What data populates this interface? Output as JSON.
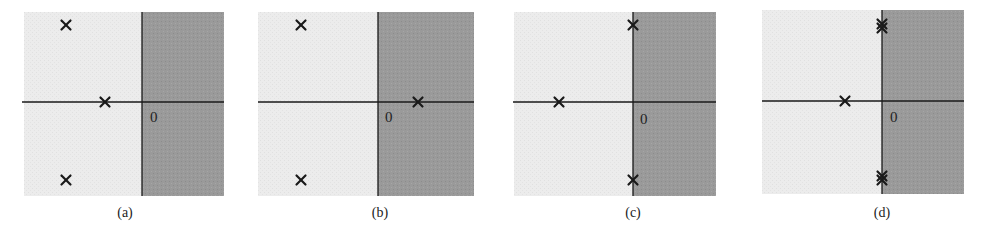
{
  "figure": {
    "title": "",
    "colors": {
      "stable_region": "#ececec",
      "unstable_region": "#9a9a9a",
      "axis": "#1a1a1a",
      "pole": "#1a1a1a",
      "background": "#ffffff"
    },
    "panels": [
      {
        "id": "a",
        "caption": "(a)",
        "origin_label": "0",
        "box": {
          "x0": 24,
          "x1": 224,
          "y0": 12,
          "y1": 196
        },
        "axis_x": 142,
        "axis_y": 102,
        "haxis_left": 22,
        "label_pos": {
          "x": 150,
          "y": 122
        },
        "caption_pos": {
          "x": 125,
          "y": 217
        },
        "poles": [
          {
            "x": 66,
            "y": 25,
            "count": 1
          },
          {
            "x": 105,
            "y": 102,
            "count": 1
          },
          {
            "x": 66,
            "y": 180,
            "count": 1
          }
        ]
      },
      {
        "id": "b",
        "caption": "(b)",
        "origin_label": "0",
        "box": {
          "x0": 258,
          "x1": 474,
          "y0": 12,
          "y1": 196
        },
        "axis_x": 378,
        "axis_y": 102,
        "haxis_left": 258,
        "label_pos": {
          "x": 385,
          "y": 122
        },
        "caption_pos": {
          "x": 380,
          "y": 217
        },
        "poles": [
          {
            "x": 301,
            "y": 25,
            "count": 1
          },
          {
            "x": 418,
            "y": 102,
            "count": 1
          },
          {
            "x": 301,
            "y": 180,
            "count": 1
          }
        ]
      },
      {
        "id": "c",
        "caption": "(c)",
        "origin_label": "0",
        "box": {
          "x0": 514,
          "x1": 716,
          "y0": 12,
          "y1": 196
        },
        "axis_x": 633,
        "axis_y": 102,
        "haxis_left": 513,
        "label_pos": {
          "x": 640,
          "y": 124
        },
        "caption_pos": {
          "x": 633,
          "y": 217
        },
        "poles": [
          {
            "x": 633,
            "y": 25,
            "count": 1
          },
          {
            "x": 559,
            "y": 102,
            "count": 1
          },
          {
            "x": 633,
            "y": 180,
            "count": 1
          }
        ]
      },
      {
        "id": "d",
        "caption": "(d)",
        "origin_label": "0",
        "box": {
          "x0": 762,
          "x1": 964,
          "y0": 10,
          "y1": 194
        },
        "axis_x": 882,
        "axis_y": 101,
        "haxis_left": 762,
        "label_pos": {
          "x": 890,
          "y": 122
        },
        "caption_pos": {
          "x": 882,
          "y": 217
        },
        "poles": [
          {
            "x": 882,
            "y": 26,
            "count": 2
          },
          {
            "x": 845,
            "y": 101,
            "count": 1
          },
          {
            "x": 882,
            "y": 178,
            "count": 2
          }
        ]
      }
    ]
  }
}
